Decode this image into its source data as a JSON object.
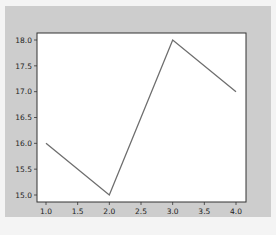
{
  "chart_data": {
    "type": "line",
    "title": "",
    "xlabel": "",
    "ylabel": "",
    "x": [
      1.0,
      2.0,
      3.0,
      4.0
    ],
    "series": [
      {
        "name": "line",
        "values": [
          16.0,
          15.0,
          18.0,
          17.0
        ],
        "color": "#6e6e6e"
      }
    ],
    "xlim": [
      0.85,
      4.15
    ],
    "ylim": [
      14.85,
      18.15
    ],
    "xticks": [
      "1.0",
      "1.5",
      "2.0",
      "2.5",
      "3.0",
      "3.5",
      "4.0"
    ],
    "yticks": [
      "15.0",
      "15.5",
      "16.0",
      "16.5",
      "17.0",
      "17.5",
      "18.0"
    ],
    "grid": false,
    "legend": null
  },
  "colors": {
    "figure_bg": "#cdcdcd",
    "axes_bg": "#ffffff",
    "line": "#6e6e6e",
    "spine": "#333333"
  }
}
